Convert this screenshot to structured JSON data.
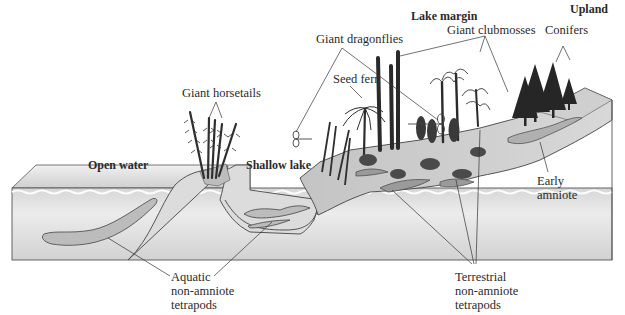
{
  "figure": {
    "title_partial": "",
    "colors": {
      "water_top": "#d4d4d4",
      "water_body": "#e6e6e6",
      "water_deep": "#cfcfcf",
      "land": "#bdbdbd",
      "land_light": "#d9d9d9",
      "tree_dark": "#2b2b2b",
      "outline": "#4a4a4a"
    }
  },
  "zones": {
    "open_water": "Open water",
    "shallow_lake": "Shallow lake",
    "lake_margin": "Lake margin",
    "upland": "Upland"
  },
  "labels": {
    "giant_horsetails": "Giant horsetails",
    "giant_dragonflies": "Giant dragonflies",
    "seed_fern": "Seed fern",
    "giant_clubmosses": "Giant clubmosses",
    "conifers": "Conifers",
    "early_amniote": [
      "Early",
      "amniote"
    ],
    "aquatic_tetrapods": [
      "Aquatic",
      "non-amniote",
      "tetrapods"
    ],
    "terrestrial_tetrapods": [
      "Terrestrial",
      "non-amniote",
      "tetrapods"
    ]
  }
}
